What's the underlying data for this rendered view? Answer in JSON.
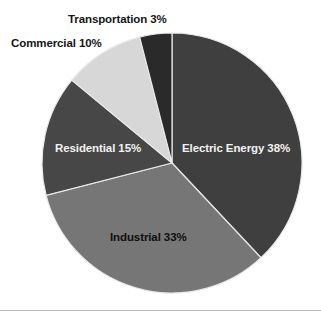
{
  "chart_data": {
    "type": "pie",
    "title": "",
    "subtitle": "",
    "xlabel": "",
    "ylabel": "",
    "legend_position": "none",
    "grid": false,
    "labels_inline": true,
    "start_angle_deg": 0,
    "direction": "clockwise",
    "categories": [
      "Electric Energy",
      "Industrial",
      "Residential",
      "Commercial",
      "Transportation"
    ],
    "values": [
      38,
      33,
      15,
      10,
      3
    ],
    "unit": "%",
    "total": 99,
    "slices": [
      {
        "name": "Electric Energy",
        "value": 38,
        "label": "Electric Energy 38%",
        "color": "#3f3f3f",
        "start_deg": 0,
        "end_deg": 136.8,
        "label_color": "#f2f2f2"
      },
      {
        "name": "Industrial",
        "value": 33,
        "label": "Industrial 33%",
        "color": "#767676",
        "start_deg": 136.8,
        "end_deg": 255.6,
        "label_color": "#0f0f0f"
      },
      {
        "name": "Residential",
        "value": 15,
        "label": "Residential 15%",
        "color": "#474747",
        "start_deg": 255.6,
        "end_deg": 309.6,
        "label_color": "#f2f2f2"
      },
      {
        "name": "Commercial",
        "value": 10,
        "label": "Commercial 10%",
        "color": "#d7d7d7",
        "start_deg": 309.6,
        "end_deg": 345.6,
        "label_color": "#161616"
      },
      {
        "name": "Transportation",
        "value": 3,
        "label": "Transportation 3%",
        "color": "#2a2a2a",
        "start_deg": 345.6,
        "end_deg": 360,
        "label_color": "#161616"
      }
    ],
    "geometry": {
      "center_x": 172,
      "center_y": 163,
      "radius": 130
    },
    "colors": {
      "background": "#ffffff",
      "separator": "#e8e8e8",
      "rule": "#b9b9b9"
    }
  }
}
